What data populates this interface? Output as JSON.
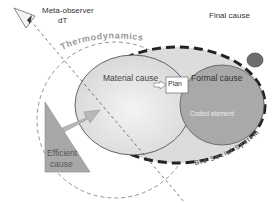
{
  "diagram": {
    "observer": {
      "label": "Meta-observer",
      "sublabel": "dT"
    },
    "thermodynamics": {
      "label": "Thermodynamics"
    },
    "bio_social": {
      "label": "Bio Social System"
    },
    "final_cause": {
      "label": "Final cause",
      "color": "#6e6e6e"
    },
    "material_cause": {
      "label": "Material cause"
    },
    "formal_cause": {
      "label": "Formal cause",
      "sublabel": "Coded element",
      "color": "#a9a9a9"
    },
    "plan": {
      "label": "Plan"
    },
    "efficient_cause": {
      "line1": "Efficient",
      "line2": "cause",
      "color": "#a8a8a8"
    }
  }
}
